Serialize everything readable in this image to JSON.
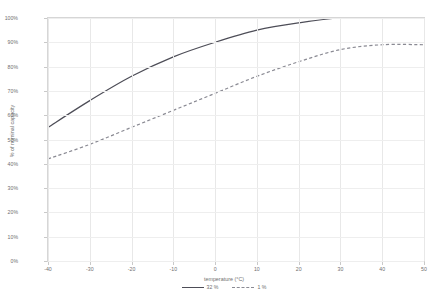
{
  "chart_data": {
    "type": "line",
    "title": "",
    "xlabel": "temperature (°C)",
    "ylabel": "% of nominal capacity",
    "xlim": [
      -40,
      50
    ],
    "ylim": [
      0,
      100
    ],
    "grid": true,
    "legend_position": "bottom",
    "xticks": [
      "-40",
      "-30",
      "-20",
      "-10",
      "0",
      "10",
      "20",
      "30",
      "40",
      "50"
    ],
    "xtick_values": [
      -40,
      -30,
      -20,
      -10,
      0,
      10,
      20,
      30,
      40,
      50
    ],
    "yticks": [
      "0%",
      "10%",
      "20%",
      "30%",
      "40%",
      "50%",
      "60%",
      "70%",
      "80%",
      "90%",
      "100%"
    ],
    "ytick_values": [
      0,
      10,
      20,
      30,
      40,
      50,
      60,
      70,
      80,
      90,
      100
    ],
    "x": [
      -40,
      -30,
      -20,
      -10,
      0,
      10,
      20,
      30,
      40,
      50
    ],
    "series": [
      {
        "name": "32 %",
        "style": "solid",
        "color": "#4d4d57",
        "values": [
          55,
          66,
          76,
          84,
          90,
          95,
          98,
          100,
          100,
          100
        ]
      },
      {
        "name": "1 %",
        "style": "dashed",
        "color": "#8a8a93",
        "values": [
          42,
          48,
          55,
          62,
          69,
          76,
          82,
          87,
          89,
          89
        ]
      }
    ]
  },
  "legend": {
    "entries": [
      {
        "label": "32 %"
      },
      {
        "label": "1 %"
      }
    ]
  },
  "axes": {
    "x_title": "temperature (°C)",
    "y_title": "% of nominal capacity"
  },
  "colors": {
    "series_solid": "#4d4d57",
    "series_dashed": "#8a8a93",
    "frame": "#d6d6d6",
    "grid": "#eeeeee",
    "text": "#6f6f6f",
    "background": "#ffffff"
  }
}
